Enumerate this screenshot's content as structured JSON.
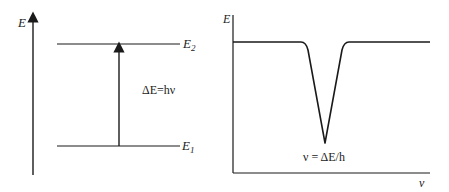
{
  "energy_level_diagram": {
    "axis_label": "E",
    "upper_level": {
      "label": "E",
      "subscript": "2"
    },
    "lower_level": {
      "label": "E",
      "subscript": "1"
    },
    "transition_label": "ΔE=hν"
  },
  "absorption_spectrum": {
    "y_axis_label": "E",
    "x_axis_label": "ν",
    "peak_label": "ν = ΔE/h"
  },
  "colors": {
    "line": "#1a1a1a",
    "text": "#222222"
  }
}
